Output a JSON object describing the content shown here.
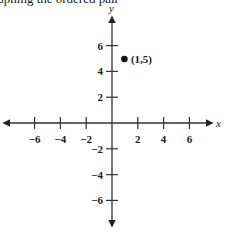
{
  "caption": "aphing the ordered pair",
  "chart_data": {
    "type": "scatter",
    "title": "",
    "xlabel": "x",
    "ylabel": "y",
    "xlim": [
      -7,
      7
    ],
    "ylim": [
      -7,
      7
    ],
    "xticks": [
      -6,
      -4,
      -2,
      2,
      4,
      6
    ],
    "yticks": [
      -6,
      -4,
      -2,
      2,
      4,
      6
    ],
    "xtick_labels": [
      "−6",
      "−4",
      "−2",
      "2",
      "4",
      "6"
    ],
    "ytick_labels": [
      "−6",
      "−4",
      "−2",
      "2",
      "4",
      "6"
    ],
    "grid": false,
    "points": [
      {
        "x": 1,
        "y": 5,
        "label": "(1,5)"
      }
    ]
  }
}
